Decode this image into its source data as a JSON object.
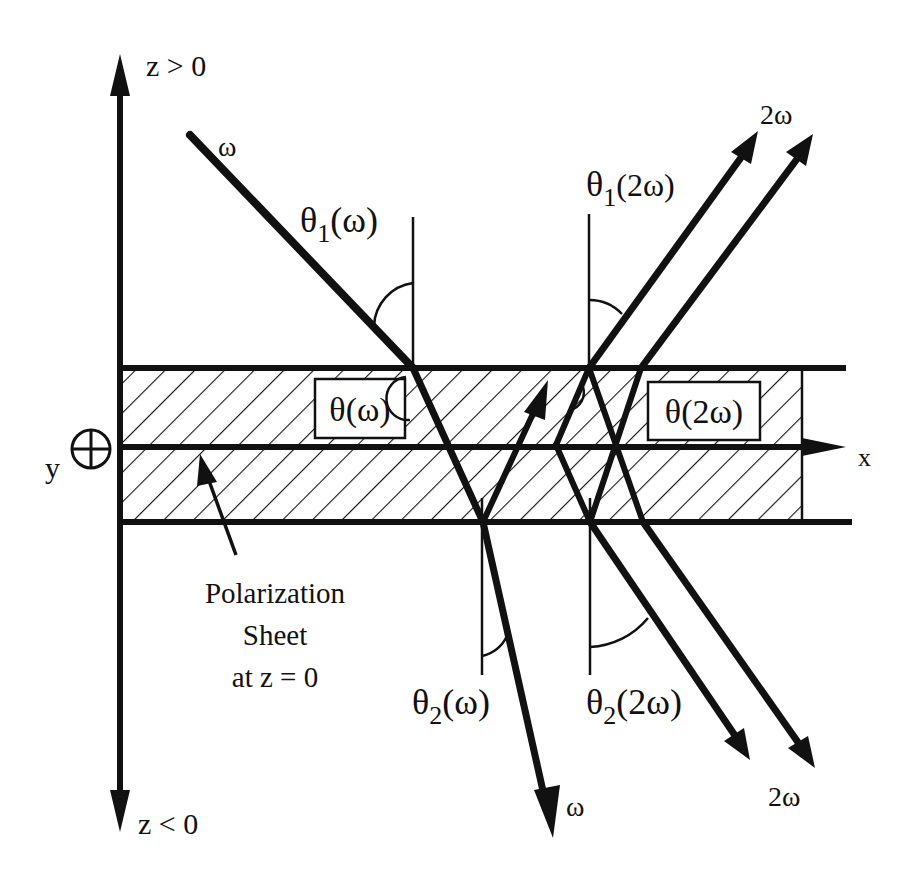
{
  "diagram": {
    "type": "optics-schematic",
    "axes": {
      "z_positive_label": "z > 0",
      "z_negative_label": "z < 0",
      "x_label": "x",
      "y_label": "y",
      "y_symbol": "⊕"
    },
    "sheet": {
      "label_line1": "Polarization",
      "label_line2": "Sheet",
      "label_line3": "at z = 0"
    },
    "beams": {
      "incident_omega": "ω",
      "transmitted_omega": "ω",
      "reflected_2omega": "2ω",
      "transmitted_2omega": "2ω"
    },
    "angles": {
      "theta1_omega": {
        "symbol": "θ",
        "sub": "1",
        "arg": "(ω)"
      },
      "theta1_2omega": {
        "symbol": "θ",
        "sub": "1",
        "arg": "(2ω)"
      },
      "theta2_omega": {
        "symbol": "θ",
        "sub": "2",
        "arg": "(ω)"
      },
      "theta2_2omega": {
        "symbol": "θ",
        "sub": "2",
        "arg": "(2ω)"
      },
      "theta_omega_box": "θ(ω)",
      "theta_2omega_box": "θ(2ω)"
    },
    "colors": {
      "ink": "#111111",
      "background": "#ffffff"
    }
  }
}
